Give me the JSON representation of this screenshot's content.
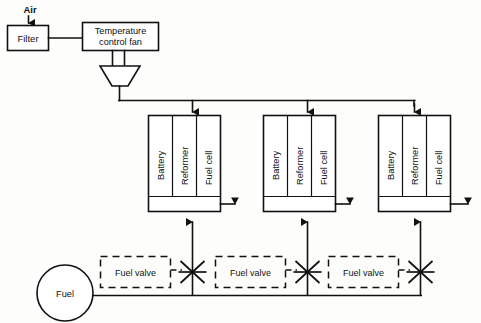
{
  "diagram": {
    "background_color": "#fdfdfb",
    "line_color": "#111111",
    "air_label": "Air",
    "filter_label": "Filter",
    "fan_label_line1": "Temperature",
    "fan_label_line2": "control  fan",
    "fuel_source_label": "Fuel",
    "modules": [
      {
        "id": "module-1",
        "cells": [
          "Battery",
          "Reformer",
          "Fuel  cell"
        ]
      },
      {
        "id": "module-2",
        "cells": [
          "Battery",
          "Reformer",
          "Fuel  cell"
        ]
      },
      {
        "id": "module-3",
        "cells": [
          "Battery",
          "Reformer",
          "Fuel  cell"
        ]
      }
    ],
    "valves": [
      {
        "id": "fuel-valve-1",
        "label": "Fuel  valve"
      },
      {
        "id": "fuel-valve-2",
        "label": "Fuel  valve"
      },
      {
        "id": "fuel-valve-3",
        "label": "Fuel  valve"
      }
    ],
    "icons": {
      "air_inlet": "down-arrow-icon",
      "air_distribution": "down-arrow-icon",
      "fuel_riser": "up-arrow-icon",
      "module_output": "right-arrow-icon",
      "valve_symbol": "valve-asterisk-icon",
      "duct": "trapezoid-duct-icon"
    }
  }
}
